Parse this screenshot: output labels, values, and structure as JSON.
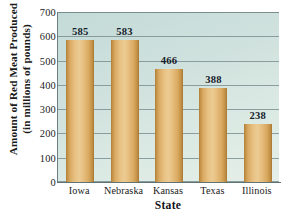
{
  "chart_data": {
    "type": "bar",
    "title": "",
    "categories": [
      "Iowa",
      "Nebraska",
      "Kansas",
      "Texas",
      "Illinois"
    ],
    "values": [
      585,
      583,
      466,
      388,
      238
    ],
    "value_labels": [
      "585",
      "583",
      "466",
      "388",
      "238"
    ],
    "xlabel": "State",
    "ylabel_line1": "Amount of Red Meat Produced",
    "ylabel_line2": "(in millions of pounds)",
    "ylim": [
      0,
      700
    ],
    "ytick_values": [
      700,
      600,
      500,
      400,
      300,
      200,
      100,
      0
    ],
    "ytick_labels": [
      "700",
      "600",
      "500",
      "400",
      "300",
      "200",
      "100",
      "0"
    ],
    "grid": "horizontal",
    "legend": "none",
    "colors": {
      "plot_background": "#cfe1dd",
      "bar_fill": "#e3bc80",
      "bar_edge": "#b07c34",
      "gridline": "#7d9193",
      "axis_line": "#5f7274",
      "text": "#1b1b1b"
    }
  }
}
